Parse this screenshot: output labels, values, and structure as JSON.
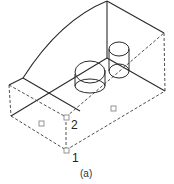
{
  "figure": {
    "caption": "(a)",
    "point_labels": [
      {
        "id": "1",
        "text": "1"
      },
      {
        "id": "2",
        "text": "2"
      }
    ],
    "colors": {
      "line": "#2a2a2a",
      "marker": "#888888",
      "background": "#ffffff"
    }
  }
}
